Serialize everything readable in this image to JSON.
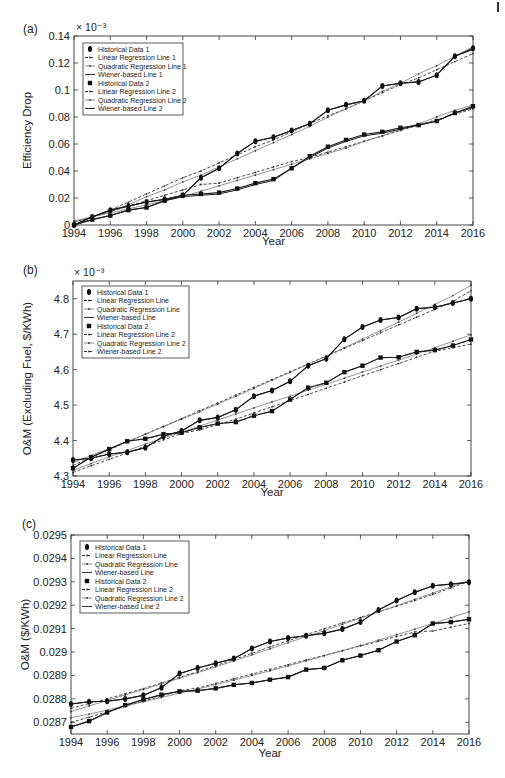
{
  "chart_data": [
    {
      "panel": "(a)",
      "type": "line",
      "title": "",
      "xlabel": "Year",
      "ylabel": "Efficiency Drop",
      "y_multiplier": "× 10⁻³",
      "xlim": [
        1994,
        2016
      ],
      "ylim": [
        0,
        0.14
      ],
      "xticks": [
        1994,
        1996,
        1998,
        2000,
        2002,
        2004,
        2006,
        2008,
        2010,
        2012,
        2014,
        2016
      ],
      "yticks": [
        0,
        0.02,
        0.04,
        0.06,
        0.08,
        0.1,
        0.12,
        0.14
      ],
      "ytick_labels": [
        "0",
        "0.02",
        "0.04",
        "0.06",
        "0.08",
        "0.1",
        "0.12",
        "0.14"
      ],
      "grid": false,
      "legend_position": "upper left",
      "legend": [
        "Historical Data 1",
        "Linear Regression Line 1",
        "Quadratic Regression Line 1",
        "Wiener-based Line 1",
        "Historical Data 2",
        "Linear Regression Line 2",
        "Quadratic Regression Line 2",
        "Wiener-based Line 2"
      ],
      "x": [
        1994,
        1995,
        1996,
        1997,
        1998,
        1999,
        2000,
        2001,
        2002,
        2003,
        2004,
        2005,
        2006,
        2007,
        2008,
        2009,
        2010,
        2011,
        2012,
        2013,
        2014,
        2015,
        2016
      ],
      "series": [
        {
          "name": "Historical Data 1",
          "style": "marker-diamond",
          "values": [
            0.0,
            0.006,
            0.011,
            0.014,
            0.017,
            0.019,
            0.022,
            0.035,
            0.042,
            0.053,
            0.062,
            0.065,
            0.07,
            0.075,
            0.085,
            0.089,
            0.092,
            0.103,
            0.105,
            0.106,
            0.111,
            0.125,
            0.131
          ]
        },
        {
          "name": "Linear Regression Line 1",
          "style": "dashed",
          "values": [
            0.0,
            0.006,
            0.011,
            0.017,
            0.023,
            0.029,
            0.035,
            0.04,
            0.046,
            0.052,
            0.058,
            0.063,
            0.069,
            0.075,
            0.081,
            0.086,
            0.092,
            0.098,
            0.104,
            0.109,
            0.115,
            0.121,
            0.127
          ]
        },
        {
          "name": "Quadratic Regression Line 1",
          "style": "dotted",
          "values": [
            0.002,
            0.006,
            0.01,
            0.015,
            0.021,
            0.026,
            0.032,
            0.037,
            0.043,
            0.049,
            0.055,
            0.061,
            0.067,
            0.073,
            0.08,
            0.086,
            0.092,
            0.099,
            0.105,
            0.112,
            0.118,
            0.125,
            0.132
          ]
        },
        {
          "name": "Wiener-based Line 1",
          "style": "solid",
          "values": [
            0.0,
            0.006,
            0.011,
            0.014,
            0.017,
            0.019,
            0.022,
            0.035,
            0.042,
            0.053,
            0.062,
            0.065,
            0.07,
            0.075,
            0.085,
            0.089,
            0.092,
            0.103,
            0.105,
            0.106,
            0.111,
            0.125,
            0.13
          ]
        },
        {
          "name": "Historical Data 2",
          "style": "marker-square",
          "values": [
            0.0,
            0.004,
            0.007,
            0.011,
            0.013,
            0.018,
            0.022,
            0.023,
            0.024,
            0.027,
            0.031,
            0.034,
            0.042,
            0.051,
            0.058,
            0.063,
            0.067,
            0.069,
            0.072,
            0.074,
            0.077,
            0.083,
            0.088
          ]
        },
        {
          "name": "Linear Regression Line 2",
          "style": "dashed",
          "values": [
            0.002,
            0.006,
            0.01,
            0.014,
            0.018,
            0.022,
            0.026,
            0.03,
            0.031,
            0.035,
            0.039,
            0.043,
            0.047,
            0.05,
            0.054,
            0.058,
            0.062,
            0.066,
            0.07,
            0.074,
            0.078,
            0.082,
            0.086
          ]
        },
        {
          "name": "Quadratic Regression Line 2",
          "style": "dotted",
          "values": [
            0.003,
            0.006,
            0.009,
            0.012,
            0.015,
            0.018,
            0.021,
            0.025,
            0.029,
            0.033,
            0.037,
            0.041,
            0.045,
            0.049,
            0.053,
            0.057,
            0.062,
            0.066,
            0.071,
            0.075,
            0.08,
            0.085,
            0.089
          ]
        },
        {
          "name": "Wiener-based Line 2",
          "style": "solid",
          "values": [
            0.0,
            0.004,
            0.007,
            0.011,
            0.013,
            0.018,
            0.021,
            0.022,
            0.023,
            0.026,
            0.03,
            0.033,
            0.042,
            0.05,
            0.057,
            0.062,
            0.066,
            0.068,
            0.071,
            0.074,
            0.077,
            0.083,
            0.087
          ]
        }
      ]
    },
    {
      "panel": "(b)",
      "type": "line",
      "title": "",
      "xlabel": "Year",
      "ylabel": "O&M (Excluding Fuel, $/KWh)",
      "y_multiplier": "× 10⁻³",
      "xlim": [
        1994,
        2016
      ],
      "ylim": [
        4.3,
        4.85
      ],
      "xticks": [
        1994,
        1996,
        1998,
        2000,
        2002,
        2004,
        2006,
        2008,
        2010,
        2012,
        2014,
        2016
      ],
      "yticks": [
        4.3,
        4.4,
        4.5,
        4.6,
        4.7,
        4.8
      ],
      "ytick_labels": [
        "4.3",
        "4.4",
        "4.5",
        "4.6",
        "4.7",
        "4.8"
      ],
      "grid": false,
      "legend_position": "upper left",
      "legend": [
        "Historical Data 1",
        "Linear Regression Line",
        "Quadratic Regression Line",
        "Wiener-based Line",
        "Historical Data 2",
        "Linear Regression Line 2",
        "Quadratic Regression Line 2",
        "Wiener-based Line 2"
      ],
      "x": [
        1994,
        1995,
        1996,
        1997,
        1998,
        1999,
        2000,
        2001,
        2002,
        2003,
        2004,
        2005,
        2006,
        2007,
        2008,
        2009,
        2010,
        2011,
        2012,
        2013,
        2014,
        2015,
        2016
      ],
      "series": [
        {
          "name": "Historical Data 1",
          "style": "marker-diamond",
          "values": [
            4.345,
            4.35,
            4.362,
            4.367,
            4.38,
            4.412,
            4.427,
            4.457,
            4.465,
            4.487,
            4.525,
            4.541,
            4.567,
            4.611,
            4.631,
            4.686,
            4.72,
            4.74,
            4.747,
            4.772,
            4.776,
            4.788,
            4.8
          ]
        },
        {
          "name": "Linear Regression Line",
          "style": "dashed",
          "values": [
            4.33,
            4.352,
            4.374,
            4.396,
            4.418,
            4.44,
            4.462,
            4.484,
            4.506,
            4.528,
            4.55,
            4.572,
            4.594,
            4.616,
            4.638,
            4.66,
            4.682,
            4.704,
            4.726,
            4.748,
            4.77,
            4.792,
            4.823
          ]
        },
        {
          "name": "Quadratic Regression Line",
          "style": "dotted",
          "values": [
            4.338,
            4.358,
            4.377,
            4.397,
            4.418,
            4.439,
            4.46,
            4.481,
            4.503,
            4.525,
            4.547,
            4.57,
            4.592,
            4.615,
            4.638,
            4.662,
            4.686,
            4.71,
            4.734,
            4.759,
            4.784,
            4.809,
            4.838
          ]
        },
        {
          "name": "Wiener-based Line",
          "style": "solid",
          "values": [
            4.345,
            4.35,
            4.362,
            4.367,
            4.38,
            4.412,
            4.427,
            4.457,
            4.465,
            4.487,
            4.525,
            4.541,
            4.567,
            4.611,
            4.631,
            4.686,
            4.72,
            4.74,
            4.747,
            4.772,
            4.776,
            4.788,
            4.8
          ]
        },
        {
          "name": "Historical Data 2",
          "style": "marker-square",
          "values": [
            4.322,
            4.353,
            4.376,
            4.398,
            4.405,
            4.418,
            4.422,
            4.437,
            4.448,
            4.452,
            4.47,
            4.483,
            4.516,
            4.549,
            4.563,
            4.593,
            4.611,
            4.634,
            4.635,
            4.65,
            4.655,
            4.668,
            4.685
          ]
        },
        {
          "name": "Linear Regression Line 2",
          "style": "dashed",
          "values": [
            4.31,
            4.329,
            4.347,
            4.365,
            4.384,
            4.402,
            4.42,
            4.43,
            4.445,
            4.46,
            4.478,
            4.495,
            4.513,
            4.53,
            4.548,
            4.565,
            4.583,
            4.6,
            4.617,
            4.635,
            4.652,
            4.662,
            4.672
          ]
        },
        {
          "name": "Quadratic Regression Line 2",
          "style": "dotted",
          "values": [
            4.316,
            4.335,
            4.354,
            4.372,
            4.39,
            4.407,
            4.424,
            4.441,
            4.458,
            4.475,
            4.492,
            4.509,
            4.525,
            4.542,
            4.559,
            4.576,
            4.593,
            4.61,
            4.627,
            4.644,
            4.662,
            4.68,
            4.698
          ]
        },
        {
          "name": "Wiener-based Line 2",
          "style": "dashed",
          "values": [
            4.322,
            4.353,
            4.376,
            4.398,
            4.405,
            4.418,
            4.422,
            4.437,
            4.448,
            4.452,
            4.47,
            4.483,
            4.516,
            4.549,
            4.563,
            4.593,
            4.611,
            4.634,
            4.635,
            4.65,
            4.655,
            4.668,
            4.685
          ]
        }
      ]
    },
    {
      "panel": "(c)",
      "type": "line",
      "title": "",
      "xlabel": "Year",
      "ylabel": "O&M ($/KWh)",
      "y_multiplier": "",
      "xlim": [
        1994,
        2016
      ],
      "ylim": [
        0.02865,
        0.0295
      ],
      "xticks": [
        1994,
        1996,
        1998,
        2000,
        2002,
        2004,
        2006,
        2008,
        2010,
        2012,
        2014,
        2016
      ],
      "yticks": [
        0.0287,
        0.0288,
        0.0289,
        0.029,
        0.0291,
        0.0292,
        0.0293,
        0.0294,
        0.0295
      ],
      "ytick_labels": [
        "0.0287",
        "0.0288",
        "0.0289",
        "0.029",
        "0.0291",
        "0.0292",
        "0.0293",
        "0.0294",
        "0.0295"
      ],
      "grid": false,
      "legend_position": "upper left",
      "legend": [
        "Historical Data 1",
        "Linear Regression Line",
        "Quadratic Regression Line",
        "Wiener-based Line",
        "Historical Data 2",
        "Linear Regression Line 2",
        "Quadratic Regression Line 2",
        "Wiener-based Line 2"
      ],
      "x": [
        1994,
        1995,
        1996,
        1997,
        1998,
        1999,
        2000,
        2001,
        2002,
        2003,
        2004,
        2005,
        2006,
        2007,
        2008,
        2009,
        2010,
        2011,
        2012,
        2013,
        2014,
        2015,
        2016
      ],
      "series": [
        {
          "name": "Historical Data 1",
          "style": "marker-diamond",
          "values": [
            0.028778,
            0.028788,
            0.02879,
            0.0288,
            0.028815,
            0.028848,
            0.028908,
            0.028932,
            0.028952,
            0.028972,
            0.029015,
            0.029045,
            0.02906,
            0.02907,
            0.02908,
            0.029098,
            0.029128,
            0.02918,
            0.02922,
            0.029255,
            0.029283,
            0.02929,
            0.029298
          ]
        },
        {
          "name": "Linear Regression Line",
          "style": "dashed",
          "values": [
            0.02876,
            0.02878,
            0.0288,
            0.028822,
            0.028844,
            0.028868,
            0.028892,
            0.028916,
            0.028942,
            0.028968,
            0.028995,
            0.029022,
            0.029048,
            0.029074,
            0.0291,
            0.029124,
            0.029148,
            0.029172,
            0.029196,
            0.02922,
            0.029246,
            0.029274,
            0.029303
          ]
        },
        {
          "name": "Quadratic Regression Line",
          "style": "dotted",
          "values": [
            0.028746,
            0.02877,
            0.028793,
            0.028817,
            0.02884,
            0.028864,
            0.028888,
            0.028912,
            0.028937,
            0.028962,
            0.028988,
            0.029014,
            0.02904,
            0.029066,
            0.029092,
            0.029118,
            0.029145,
            0.029171,
            0.029198,
            0.029225,
            0.029252,
            0.029279,
            0.029306
          ]
        },
        {
          "name": "Wiener-based Line",
          "style": "solid",
          "values": [
            0.028778,
            0.028788,
            0.02879,
            0.0288,
            0.028815,
            0.028848,
            0.028908,
            0.028932,
            0.028952,
            0.028972,
            0.029015,
            0.029045,
            0.02906,
            0.02907,
            0.02908,
            0.029098,
            0.029128,
            0.02918,
            0.02922,
            0.029255,
            0.029283,
            0.02929,
            0.029298
          ]
        },
        {
          "name": "Historical Data 2",
          "style": "marker-square",
          "values": [
            0.02868,
            0.028705,
            0.028742,
            0.028773,
            0.028797,
            0.028818,
            0.028832,
            0.028835,
            0.028845,
            0.02886,
            0.028868,
            0.028882,
            0.028893,
            0.028925,
            0.028932,
            0.028965,
            0.028985,
            0.029008,
            0.029045,
            0.029072,
            0.029122,
            0.029128,
            0.02914
          ]
        },
        {
          "name": "Linear Regression Line 2",
          "style": "dashed",
          "values": [
            0.0287,
            0.028722,
            0.028745,
            0.028768,
            0.02879,
            0.028812,
            0.028835,
            0.028846,
            0.028866,
            0.028886,
            0.028906,
            0.028926,
            0.028946,
            0.028966,
            0.028986,
            0.029006,
            0.029026,
            0.029046,
            0.029066,
            0.029086,
            0.02909,
            0.029106,
            0.029122
          ]
        },
        {
          "name": "Quadratic Regression Line 2",
          "style": "dotted",
          "values": [
            0.02872,
            0.028735,
            0.028752,
            0.02877,
            0.028788,
            0.028806,
            0.028824,
            0.028842,
            0.028861,
            0.02888,
            0.0289,
            0.02892,
            0.028941,
            0.028962,
            0.028984,
            0.029006,
            0.029028,
            0.029051,
            0.029074,
            0.029098,
            0.029122,
            0.029147,
            0.029172
          ]
        },
        {
          "name": "Wiener-based Line 2",
          "style": "solid",
          "values": [
            0.02868,
            0.028705,
            0.028742,
            0.028773,
            0.028797,
            0.028818,
            0.028832,
            0.028835,
            0.028845,
            0.02886,
            0.028868,
            0.028882,
            0.028893,
            0.028925,
            0.028932,
            0.028965,
            0.028985,
            0.029008,
            0.029045,
            0.029072,
            0.029122,
            0.029128,
            0.02914
          ]
        }
      ]
    }
  ],
  "panels": [
    {
      "label": "(a)",
      "xlabel": "Year",
      "ylabel": "Efficiency Drop",
      "multiplier": "× 10⁻³",
      "legend": [
        "Historical Data 1",
        "Linear Regression Line 1",
        "Quadratic Regression Line 1",
        "Wiener-based Line 1",
        "Historical Data 2",
        "Linear Regression Line 2",
        "Quadratic Regression Line 2",
        "Wiener-based Line 2"
      ]
    },
    {
      "label": "(b)",
      "xlabel": "Year",
      "ylabel": "O&M (Excluding Fuel, $/KWh)",
      "multiplier": "× 10⁻³",
      "legend": [
        "Historical Data 1",
        "Linear Regression Line",
        "Quadratic Regression Line",
        "Wiener-based Line",
        "Historical Data 2",
        "Linear Regression Line 2",
        "Quadratic Regression Line 2",
        "Wiener-based Line 2"
      ]
    },
    {
      "label": "(c)",
      "xlabel": "Year",
      "ylabel": "O&M ($/KWh)",
      "multiplier": "",
      "legend": [
        "Historical Data 1",
        "Linear Regression Line",
        "Quadratic Regression Line",
        "Wiener-based Line",
        "Historical Data 2",
        "Linear Regression Line 2",
        "Quadratic Regression Line 2",
        "Wiener-based Line 2"
      ]
    }
  ],
  "colors": {
    "ink": "#1a1a1a",
    "gray_line": "#8a8a8a",
    "frame": "#333333",
    "background": "#ffffff"
  }
}
